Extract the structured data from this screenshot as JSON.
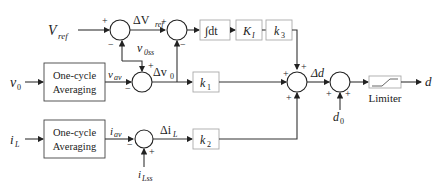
{
  "diagram": {
    "inputs": {
      "vref": "V",
      "vref_sub": "ref",
      "v0": "v",
      "v0_sub": "0",
      "iL": "i",
      "iL_sub": "L",
      "v0ss": "v",
      "v0ss_sub": "0ss",
      "iLss": "i",
      "iLss_sub": "Lss",
      "d0": "d",
      "d0_sub": "0"
    },
    "blocks": {
      "averaging_top_line1": "One-cycle",
      "averaging_top_line2": "Averaging",
      "averaging_bottom_line1": "One-cycle",
      "averaging_bottom_line2": "Averaging",
      "integrator": "∫dt",
      "ki": "K",
      "ki_sub": "I",
      "k3": "k",
      "k3_sub": "3",
      "k1": "k",
      "k1_sub": "1",
      "k2": "k",
      "k2_sub": "2",
      "limiter": "Limiter"
    },
    "signals": {
      "delta_vref": "ΔV",
      "delta_vref_sub": "ref",
      "vav": "v",
      "vav_sub": "av",
      "delta_v0": "Δv",
      "delta_v0_sub": "0",
      "iav": "i",
      "iav_sub": "av",
      "delta_iL": "Δi",
      "delta_iL_sub": "L",
      "delta_d": "Δd",
      "output": "d"
    },
    "signs": {
      "plus": "+",
      "minus": "−"
    }
  }
}
